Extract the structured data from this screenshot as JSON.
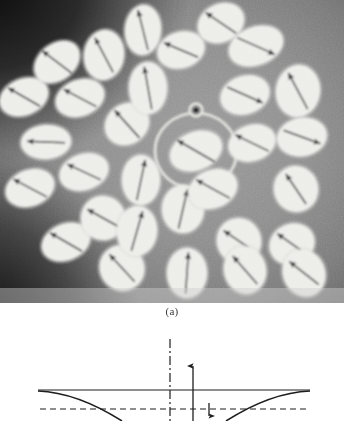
{
  "figure": {
    "caption_a": "(a)",
    "panel_a": {
      "name": "micrograph-panel",
      "description": "Photomicrograph of elliptical magnetic domain markers each containing a single dark arrow, arranged in a radial pattern around a central ring",
      "width": 344,
      "height": 303,
      "background_mid_gray": "#8c8c8c",
      "background_dark_corner": "#141414",
      "ellipse_fill": "#ededea",
      "arrow_color": "#121212",
      "center_ring": {
        "name": "center-ring",
        "cx": 196,
        "cy": 151,
        "rx": 41,
        "ry": 38,
        "stroke": "#e2e2de",
        "stroke_width": 3.2
      },
      "center_dot": {
        "name": "center-ring-bead",
        "cx": 196,
        "cy": 110,
        "r": 6.4,
        "ring_stroke": "#e2e2de",
        "core": "#1a1a1a"
      },
      "ellipses": [
        {
          "cx": 24,
          "cy": 97,
          "rx": 25,
          "ry": 18,
          "rot": -22,
          "arrow_deg": 150,
          "len": 36
        },
        {
          "cx": 57,
          "cy": 62,
          "rx": 25,
          "ry": 18,
          "rot": -38,
          "arrow_deg": 143,
          "len": 36
        },
        {
          "cx": 30,
          "cy": 188,
          "rx": 25,
          "ry": 18,
          "rot": -20,
          "arrow_deg": 152,
          "len": 37
        },
        {
          "cx": 46,
          "cy": 142,
          "rx": 25,
          "ry": 17,
          "rot": -4,
          "arrow_deg": 178,
          "len": 37
        },
        {
          "cx": 66,
          "cy": 242,
          "rx": 25,
          "ry": 18,
          "rot": -22,
          "arrow_deg": 150,
          "len": 36
        },
        {
          "cx": 80,
          "cy": 98,
          "rx": 25,
          "ry": 18,
          "rot": -20,
          "arrow_deg": 152,
          "len": 36
        },
        {
          "cx": 84,
          "cy": 172,
          "rx": 25,
          "ry": 18,
          "rot": -18,
          "arrow_deg": 155,
          "len": 36
        },
        {
          "cx": 104,
          "cy": 55,
          "rx": 20,
          "ry": 25,
          "rot": 8,
          "arrow_deg": 118,
          "len": 38
        },
        {
          "cx": 103,
          "cy": 218,
          "rx": 22,
          "ry": 22,
          "rot": -16,
          "arrow_deg": 151,
          "len": 35
        },
        {
          "cx": 122,
          "cy": 268,
          "rx": 22,
          "ry": 23,
          "rot": -38,
          "arrow_deg": 133,
          "len": 36
        },
        {
          "cx": 127,
          "cy": 124,
          "rx": 23,
          "ry": 20,
          "rot": -36,
          "arrow_deg": 132,
          "len": 36
        },
        {
          "cx": 143,
          "cy": 30,
          "rx": 18,
          "ry": 25,
          "rot": 4,
          "arrow_deg": 104,
          "len": 40
        },
        {
          "cx": 137,
          "cy": 231,
          "rx": 20,
          "ry": 25,
          "rot": 4,
          "arrow_deg": 74,
          "len": 40
        },
        {
          "cx": 148,
          "cy": 88,
          "rx": 19,
          "ry": 26,
          "rot": 0,
          "arrow_deg": 100,
          "len": 42
        },
        {
          "cx": 141,
          "cy": 180,
          "rx": 19,
          "ry": 25,
          "rot": 0,
          "arrow_deg": 78,
          "len": 40
        },
        {
          "cx": 181,
          "cy": 50,
          "rx": 24,
          "ry": 18,
          "rot": -16,
          "arrow_deg": 157,
          "len": 36
        },
        {
          "cx": 183,
          "cy": 209,
          "rx": 21,
          "ry": 24,
          "rot": 0,
          "arrow_deg": 77,
          "len": 39
        },
        {
          "cx": 196,
          "cy": 151,
          "rx": 27,
          "ry": 19,
          "rot": -22,
          "arrow_deg": 150,
          "len": 42
        },
        {
          "cx": 187,
          "cy": 273,
          "rx": 20,
          "ry": 25,
          "rot": 0,
          "arrow_deg": 86,
          "len": 40
        },
        {
          "cx": 221,
          "cy": 23,
          "rx": 24,
          "ry": 19,
          "rot": -26,
          "arrow_deg": 146,
          "len": 36
        },
        {
          "cx": 213,
          "cy": 189,
          "rx": 25,
          "ry": 19,
          "rot": -22,
          "arrow_deg": 151,
          "len": 37
        },
        {
          "cx": 239,
          "cy": 241,
          "rx": 22,
          "ry": 23,
          "rot": -22,
          "arrow_deg": 146,
          "len": 36
        },
        {
          "cx": 245,
          "cy": 270,
          "rx": 21,
          "ry": 24,
          "rot": -14,
          "arrow_deg": 131,
          "len": 36
        },
        {
          "cx": 256,
          "cy": 46,
          "rx": 28,
          "ry": 19,
          "rot": -20,
          "arrow_deg": 336,
          "len": 40
        },
        {
          "cx": 245,
          "cy": 95,
          "rx": 25,
          "ry": 19,
          "rot": -18,
          "arrow_deg": 336,
          "len": 38
        },
        {
          "cx": 252,
          "cy": 143,
          "rx": 24,
          "ry": 18,
          "rot": -18,
          "arrow_deg": 154,
          "len": 36
        },
        {
          "cx": 292,
          "cy": 244,
          "rx": 23,
          "ry": 20,
          "rot": -24,
          "arrow_deg": 145,
          "len": 35
        },
        {
          "cx": 298,
          "cy": 91,
          "rx": 22,
          "ry": 26,
          "rot": 8,
          "arrow_deg": 118,
          "len": 40
        },
        {
          "cx": 302,
          "cy": 137,
          "rx": 25,
          "ry": 19,
          "rot": -10,
          "arrow_deg": 340,
          "len": 38
        },
        {
          "cx": 296,
          "cy": 189,
          "rx": 22,
          "ry": 23,
          "rot": -18,
          "arrow_deg": 124,
          "len": 35
        },
        {
          "cx": 304,
          "cy": 273,
          "rx": 21,
          "ry": 24,
          "rot": -24,
          "arrow_deg": 142,
          "len": 36
        }
      ]
    },
    "panel_b": {
      "name": "profile-diagram-panel",
      "description": "Cross-section profile sketch: two symmetric concave curves meeting a horizontal baseline, a vertical dash-dot axis, an upward arrow and a short downward dimension arrow against a dashed reference line",
      "width": 344,
      "height": 95,
      "line_color": "#1e1e1e",
      "elements": {
        "baseline": {
          "name": "baseline",
          "x1": 38,
          "y1": 64,
          "x2": 310,
          "y2": 64
        },
        "dashed_reference": {
          "name": "dashed-reference-line",
          "x1": 40,
          "y1": 83,
          "x2": 306,
          "y2": 83,
          "dash": "6 4"
        },
        "axis_dashdot": {
          "name": "centerline-dash-dot-axis",
          "x": 170,
          "y1": 13,
          "y2": 95,
          "dash": "9 3 2 3"
        },
        "up_arrow": {
          "name": "up-arrow",
          "x": 193,
          "y_top": 39,
          "y_bottom": 95
        },
        "down_arrow": {
          "name": "down-dimension-arrow",
          "x": 209,
          "y_top": 77,
          "y_bottom": 90
        },
        "curve_left": {
          "name": "profile-curve-left",
          "from_x": 38,
          "from_y": 65,
          "to_x": 122,
          "to_y": 95
        },
        "curve_right": {
          "name": "profile-curve-right",
          "from_x": 310,
          "from_y": 65,
          "to_x": 226,
          "to_y": 95
        }
      }
    }
  }
}
